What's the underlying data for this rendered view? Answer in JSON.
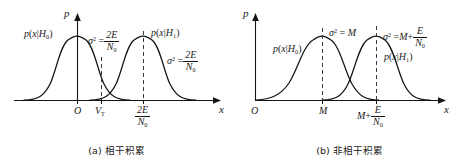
{
  "figure": {
    "panels": [
      {
        "id": "a",
        "caption": "(a) 相干积累",
        "axes": {
          "y_label": "p",
          "x_label": "x"
        },
        "curves": [
          {
            "name": "h0",
            "label_parts": {
              "p": "p",
              "open": "(",
              "x": "x",
              "bar": "|",
              "H": "H",
              "sub": "0",
              "close": ")"
            },
            "label_text": "p(x|H0)",
            "peak_tick": "O"
          },
          {
            "name": "h1",
            "label_text": "p(x|H1)",
            "label_parts": {
              "p": "p",
              "open": "(",
              "x": "x",
              "bar": "|",
              "H": "H",
              "sub": "1",
              "close": ")"
            },
            "peak_tick": "2E/N0"
          }
        ],
        "variance_annotations": [
          {
            "symbol": "σ",
            "sup": "2",
            "eq": "=",
            "num": "2E",
            "den": "N",
            "den_sub": "0"
          },
          {
            "symbol": "σ",
            "sup": "2",
            "eq": "=",
            "num": "2E",
            "den": "N",
            "den_sub": "0"
          }
        ],
        "x_ticks": [
          {
            "label": "O",
            "type": "plain"
          },
          {
            "label": "VT",
            "type": "sub",
            "base": "V",
            "sub": "T"
          },
          {
            "label": "2E/N0",
            "type": "fraction",
            "num": "2E",
            "den": "N",
            "den_sub": "0"
          }
        ]
      },
      {
        "id": "b",
        "caption": "(b) 非相干积累",
        "axes": {
          "y_label": "p",
          "x_label": "x"
        },
        "curves": [
          {
            "name": "h0",
            "label_text": "p(x|H0)",
            "label_parts": {
              "p": "p",
              "open": "(",
              "x": "x",
              "bar": "|",
              "H": "H",
              "sub": "0",
              "close": ")"
            },
            "peak_tick": "M"
          },
          {
            "name": "h1",
            "label_text": "p(x|H1)",
            "label_parts": {
              "p": "p",
              "open": "(",
              "x": "x",
              "bar": "|",
              "H": "H",
              "sub": "1",
              "close": ")"
            },
            "peak_tick": "M+E/N0"
          }
        ],
        "variance_annotations": [
          {
            "symbol": "σ",
            "sup": "2",
            "eq": "=",
            "value": "M"
          },
          {
            "symbol": "σ",
            "sup": "2",
            "eq": "=",
            "value": "M",
            "plus": "+",
            "num": "E",
            "den": "N",
            "den_sub": "0"
          }
        ],
        "x_ticks": [
          {
            "label": "O",
            "type": "plain"
          },
          {
            "label": "M",
            "type": "plain"
          },
          {
            "label": "M+E/N0",
            "type": "fraction",
            "lead": "M",
            "plus": "+",
            "num": "E",
            "den": "N",
            "den_sub": "0"
          }
        ]
      }
    ],
    "colors": {
      "stroke": "#141414",
      "dashed": "#3a3a3a",
      "background": "#ffffff"
    }
  }
}
